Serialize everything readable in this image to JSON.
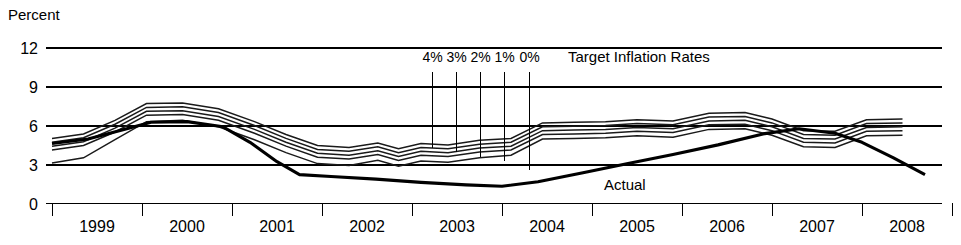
{
  "chart_data": {
    "type": "line",
    "title": "",
    "ylabel": "Percent",
    "xlabel": "",
    "ylim": [
      0,
      12
    ],
    "yticks": [
      0,
      3,
      6,
      9,
      12
    ],
    "ytick_labels": [
      "0",
      "3",
      "6",
      "9",
      "12"
    ],
    "xlim": [
      1999,
      2008.9
    ],
    "categories": [
      "1999",
      "2000",
      "2001",
      "2002",
      "2003",
      "2004",
      "2005",
      "2006",
      "2007",
      "2008"
    ],
    "grid": true,
    "legend_position": "inline-annotations",
    "annotations": [
      {
        "text": "Target Inflation Rates",
        "x_px": 568,
        "y_px": 62
      },
      {
        "text": "Actual",
        "x_px": 604,
        "y_px": 190
      }
    ],
    "target_labels": [
      "4%",
      "3%",
      "2%",
      "1%",
      "0%"
    ],
    "series": [
      {
        "name": "4%",
        "target_rate": 4,
        "x": [
          1999.0,
          1999.35,
          1999.7,
          2000.05,
          2000.45,
          2000.85,
          2001.25,
          2001.6,
          2001.95,
          2002.3,
          2002.62,
          2002.85,
          2003.1,
          2003.4,
          2003.75,
          2004.1,
          2004.45,
          2004.8,
          2005.15,
          2005.5,
          2005.9,
          2006.3,
          2006.7,
          2007.0,
          2007.35,
          2007.7,
          2008.05,
          2008.45
        ],
        "values": [
          5.0,
          5.35,
          6.4,
          7.7,
          7.75,
          7.3,
          6.3,
          5.3,
          4.45,
          4.3,
          4.65,
          4.2,
          4.6,
          4.5,
          4.85,
          5.0,
          6.2,
          6.25,
          6.3,
          6.45,
          6.35,
          6.95,
          7.0,
          6.5,
          5.6,
          5.55,
          6.45,
          6.5
        ]
      },
      {
        "name": "3%",
        "target_rate": 3,
        "x": [
          1999.0,
          1999.35,
          1999.7,
          2000.05,
          2000.45,
          2000.85,
          2001.25,
          2001.6,
          2001.95,
          2002.3,
          2002.62,
          2002.85,
          2003.1,
          2003.4,
          2003.75,
          2004.1,
          2004.45,
          2004.8,
          2005.15,
          2005.5,
          2005.9,
          2006.3,
          2006.7,
          2007.0,
          2007.35,
          2007.7,
          2008.05,
          2008.45
        ],
        "values": [
          4.7,
          5.05,
          6.1,
          7.4,
          7.45,
          7.0,
          6.0,
          5.0,
          4.15,
          4.0,
          4.35,
          3.9,
          4.3,
          4.2,
          4.55,
          4.7,
          5.9,
          5.95,
          6.0,
          6.15,
          6.05,
          6.65,
          6.7,
          6.2,
          5.3,
          5.25,
          6.15,
          6.2
        ]
      },
      {
        "name": "2%",
        "target_rate": 2,
        "x": [
          1999.0,
          1999.35,
          1999.7,
          2000.05,
          2000.45,
          2000.85,
          2001.25,
          2001.6,
          2001.95,
          2002.3,
          2002.62,
          2002.85,
          2003.1,
          2003.4,
          2003.75,
          2004.1,
          2004.45,
          2004.8,
          2005.15,
          2005.5,
          2005.9,
          2006.3,
          2006.7,
          2007.0,
          2007.35,
          2007.7,
          2008.05,
          2008.45
        ],
        "values": [
          4.4,
          4.75,
          5.8,
          7.1,
          7.15,
          6.7,
          5.7,
          4.7,
          3.85,
          3.7,
          4.05,
          3.6,
          4.0,
          3.9,
          4.25,
          4.4,
          5.6,
          5.65,
          5.7,
          5.85,
          5.75,
          6.35,
          6.4,
          5.9,
          5.0,
          4.95,
          5.85,
          5.9
        ]
      },
      {
        "name": "1%",
        "target_rate": 1,
        "x": [
          1999.0,
          1999.35,
          1999.7,
          2000.05,
          2000.45,
          2000.85,
          2001.25,
          2001.6,
          2001.95,
          2002.3,
          2002.62,
          2002.85,
          2003.1,
          2003.4,
          2003.75,
          2004.1,
          2004.45,
          2004.8,
          2005.15,
          2005.5,
          2005.9,
          2006.3,
          2006.7,
          2007.0,
          2007.35,
          2007.7,
          2008.05,
          2008.45
        ],
        "values": [
          4.1,
          4.45,
          5.5,
          6.8,
          6.85,
          6.4,
          5.4,
          4.4,
          3.55,
          3.4,
          3.75,
          3.3,
          3.7,
          3.6,
          3.95,
          4.1,
          5.3,
          5.35,
          5.4,
          5.55,
          5.45,
          6.05,
          6.1,
          5.6,
          4.7,
          4.65,
          5.55,
          5.6
        ]
      },
      {
        "name": "0%",
        "target_rate": 0,
        "x": [
          1999.0,
          1999.35,
          1999.7,
          2000.05,
          2000.45,
          2000.85,
          2001.25,
          2001.6,
          2001.95,
          2002.3,
          2002.62,
          2002.85,
          2003.1,
          2003.4,
          2003.75,
          2004.1,
          2004.45,
          2004.8,
          2005.15,
          2005.5,
          2005.9,
          2006.3,
          2006.7,
          2007.0,
          2007.35,
          2007.7,
          2008.05,
          2008.45
        ],
        "values": [
          3.1,
          3.5,
          4.9,
          6.3,
          6.4,
          5.9,
          4.9,
          3.9,
          3.05,
          2.9,
          3.3,
          2.85,
          3.25,
          3.15,
          3.5,
          3.7,
          4.95,
          5.0,
          5.05,
          5.2,
          5.1,
          5.7,
          5.75,
          5.25,
          4.35,
          4.3,
          5.2,
          5.25
        ]
      },
      {
        "name": "Actual",
        "x": [
          1999.0,
          1999.4,
          1999.8,
          2000.1,
          2000.5,
          2000.9,
          2001.2,
          2001.5,
          2001.75,
          2002.1,
          2002.6,
          2003.1,
          2003.6,
          2004.0,
          2004.4,
          2004.9,
          2005.4,
          2005.9,
          2006.4,
          2006.9,
          2007.3,
          2007.7,
          2008.0,
          2008.35,
          2008.7
        ],
        "values": [
          4.6,
          4.95,
          5.7,
          6.25,
          6.3,
          5.9,
          4.7,
          3.2,
          2.2,
          2.05,
          1.85,
          1.6,
          1.4,
          1.3,
          1.65,
          2.35,
          3.05,
          3.75,
          4.5,
          5.35,
          5.75,
          5.4,
          4.7,
          3.5,
          2.2
        ]
      }
    ],
    "target_leaders": [
      {
        "label": "4%",
        "x_px": 432,
        "y_top_px": 72,
        "y_bottom_px": 148
      },
      {
        "label": "3%",
        "x_px": 456,
        "y_top_px": 72,
        "y_bottom_px": 152
      },
      {
        "label": "2%",
        "x_px": 480,
        "y_top_px": 72,
        "y_bottom_px": 157
      },
      {
        "label": "1%",
        "x_px": 504,
        "y_top_px": 72,
        "y_bottom_px": 161
      },
      {
        "label": "0%",
        "x_px": 529,
        "y_top_px": 72,
        "y_bottom_px": 170
      }
    ]
  }
}
